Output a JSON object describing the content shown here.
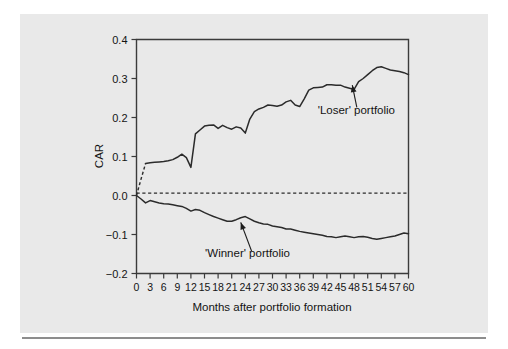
{
  "figure": {
    "background_color": "#e9e9e9",
    "page_color": "#ffffff",
    "rule_color": "#8d8d8d",
    "line_color": "#2b2b2b"
  },
  "chart_data": {
    "type": "line",
    "title": "",
    "xlabel": "Months after portfolio formation",
    "ylabel": "CAR",
    "xlim": [
      0,
      60
    ],
    "ylim": [
      -0.2,
      0.4
    ],
    "grid": false,
    "legend": "annotations",
    "xticks": [
      0,
      3,
      6,
      9,
      12,
      15,
      18,
      21,
      24,
      27,
      30,
      33,
      36,
      39,
      42,
      45,
      48,
      51,
      54,
      57,
      60
    ],
    "xtick_labels": [
      "0",
      "3",
      "6",
      "9",
      "12",
      "15",
      "18",
      "21",
      "24",
      "27",
      "30",
      "33",
      "36",
      "39",
      "42",
      "45",
      "48",
      "51",
      "54",
      "57",
      "60"
    ],
    "yticks": [
      -0.2,
      -0.1,
      0.0,
      0.1,
      0.2,
      0.3,
      0.4
    ],
    "ytick_labels": [
      "−0.2",
      "−0.1",
      "0.0",
      "0.1",
      "0.2",
      "0.3",
      "0.4"
    ],
    "reference_line": {
      "y": 0.006,
      "style": "dashed"
    },
    "x": [
      0,
      1,
      2,
      3,
      4,
      5,
      6,
      7,
      8,
      9,
      10,
      11,
      12,
      13,
      14,
      15,
      16,
      17,
      18,
      19,
      20,
      21,
      22,
      23,
      24,
      25,
      26,
      27,
      28,
      29,
      30,
      31,
      32,
      33,
      34,
      35,
      36,
      37,
      38,
      39,
      40,
      41,
      42,
      43,
      44,
      45,
      46,
      47,
      48,
      49,
      50,
      51,
      52,
      53,
      54,
      55,
      56,
      57,
      58,
      59,
      60
    ],
    "series": [
      {
        "name": "'Loser' portfolio",
        "style": "solid-with-dashed-lead",
        "dashed_lead_points": 2,
        "values": [
          0.0,
          0.042,
          0.082,
          0.084,
          0.085,
          0.086,
          0.087,
          0.089,
          0.092,
          0.098,
          0.106,
          0.097,
          0.072,
          0.158,
          0.168,
          0.178,
          0.18,
          0.181,
          0.172,
          0.18,
          0.174,
          0.17,
          0.176,
          0.173,
          0.16,
          0.196,
          0.215,
          0.222,
          0.226,
          0.232,
          0.231,
          0.229,
          0.232,
          0.24,
          0.244,
          0.232,
          0.228,
          0.248,
          0.27,
          0.276,
          0.277,
          0.278,
          0.284,
          0.284,
          0.283,
          0.283,
          0.278,
          0.275,
          0.272,
          0.292,
          0.3,
          0.31,
          0.32,
          0.328,
          0.33,
          0.326,
          0.322,
          0.32,
          0.318,
          0.315,
          0.31
        ]
      },
      {
        "name": "'Winner' portfolio",
        "style": "solid",
        "values": [
          0.0,
          -0.009,
          -0.019,
          -0.013,
          -0.016,
          -0.019,
          -0.021,
          -0.022,
          -0.024,
          -0.026,
          -0.028,
          -0.033,
          -0.04,
          -0.036,
          -0.038,
          -0.044,
          -0.049,
          -0.054,
          -0.058,
          -0.062,
          -0.066,
          -0.066,
          -0.062,
          -0.057,
          -0.054,
          -0.06,
          -0.066,
          -0.07,
          -0.073,
          -0.074,
          -0.078,
          -0.08,
          -0.082,
          -0.086,
          -0.086,
          -0.089,
          -0.092,
          -0.094,
          -0.096,
          -0.098,
          -0.1,
          -0.102,
          -0.105,
          -0.106,
          -0.108,
          -0.106,
          -0.104,
          -0.106,
          -0.108,
          -0.106,
          -0.105,
          -0.107,
          -0.11,
          -0.112,
          -0.11,
          -0.108,
          -0.106,
          -0.104,
          -0.1,
          -0.096,
          -0.098
        ]
      }
    ],
    "annotations": [
      {
        "text": "'Loser' portfolio",
        "label_x": 48.5,
        "label_y": 0.21,
        "arrow_from_x": 48.6,
        "arrow_from_y": 0.226,
        "arrow_to_x": 47.6,
        "arrow_to_y": 0.283
      },
      {
        "text": "'Winner' portfolio",
        "label_x": 24.5,
        "label_y": -0.158,
        "arrow_from_x": 25.4,
        "arrow_from_y": -0.143,
        "arrow_to_x": 23.0,
        "arrow_to_y": -0.069
      }
    ]
  }
}
